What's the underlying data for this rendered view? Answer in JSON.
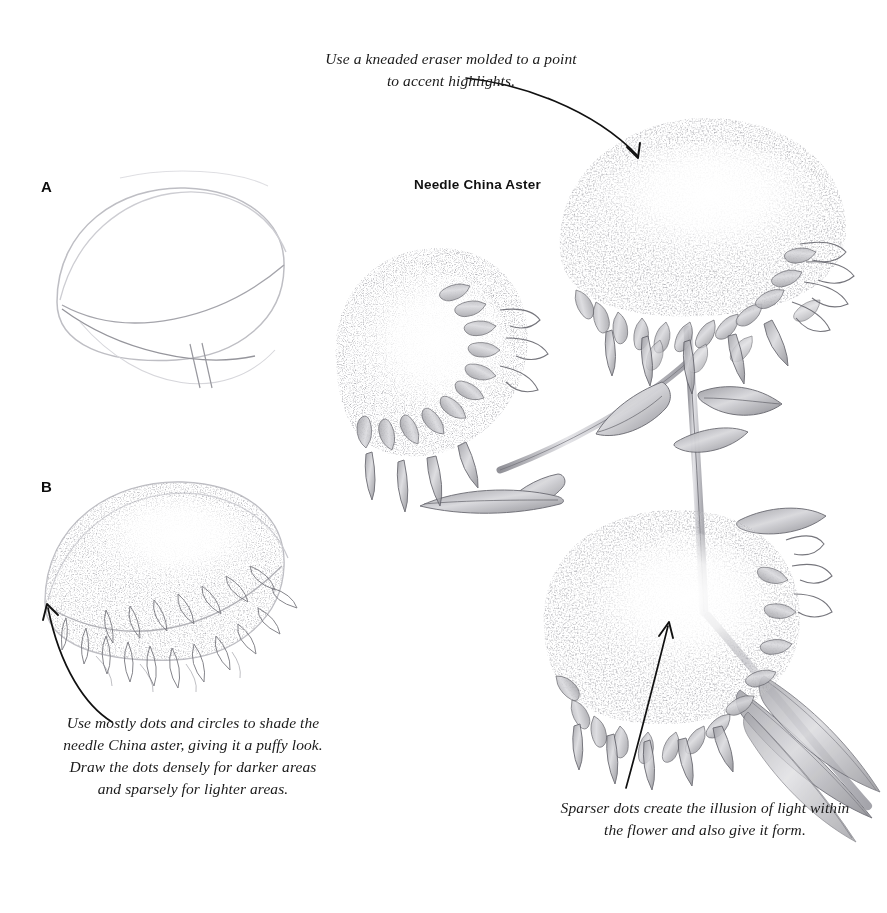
{
  "page": {
    "background_color": "#ffffff",
    "width": 887,
    "height": 913,
    "medium": "graphite pencil drawing",
    "ink_color": "#1a1a1a",
    "pencil_color": "#6e6e72"
  },
  "plate": {
    "title": "Needle China Aster"
  },
  "steps": [
    {
      "label": "A",
      "description": "light pencil outline of the rounded flower head and stem"
    },
    {
      "label": "B",
      "description": "stippled dots and circles added over the outline with petal hints"
    }
  ],
  "captions": {
    "top": "Use a kneaded eraser molded to a point to accent highlights.",
    "bottom_left": "Use mostly dots and circles to shade the needle China aster, giving it a puffy look. Draw the dots densely for darker areas and sparsely for lighter areas.",
    "bottom_right": "Sparser dots create the illusion of light within the flower and also give it form."
  },
  "arrows": [
    {
      "name": "arrow-top-to-upper-flower",
      "from": [
        468,
        78
      ],
      "to": [
        640,
        160
      ],
      "direction": "down-right"
    },
    {
      "name": "arrow-left-to-step-b",
      "from": [
        110,
        722
      ],
      "to": [
        46,
        602
      ],
      "direction": "up-left"
    },
    {
      "name": "arrow-right-to-lower-flower",
      "from": [
        628,
        786
      ],
      "to": [
        668,
        622
      ],
      "direction": "up-right"
    }
  ],
  "illustration": {
    "subject": "Needle China Aster",
    "flower_heads": [
      {
        "name": "upper-right-flower",
        "center": [
          700,
          230
        ],
        "rx": 140,
        "ry": 92
      },
      {
        "name": "middle-left-flower",
        "center": [
          432,
          355
        ],
        "rx": 95,
        "ry": 92
      },
      {
        "name": "lower-right-flower",
        "center": [
          672,
          625
        ],
        "rx": 128,
        "ry": 100
      }
    ],
    "stems": 3,
    "leaves": 7
  }
}
